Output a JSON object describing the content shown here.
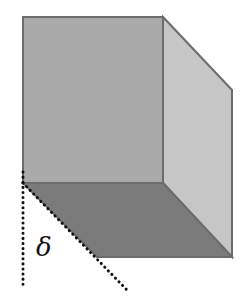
{
  "diagram": {
    "shape": "parallelepiped",
    "label": {
      "text": "δ",
      "meaning": "shear angle",
      "x": 36,
      "y": 256
    },
    "colors": {
      "front_face": "#a9a9a9",
      "right_face": "#c6c6c6",
      "bottom_face": "#7b7b7b",
      "edge": "#6c6c6c",
      "dotted_line": "#111111",
      "background": "#ffffff"
    },
    "faces": {
      "front": [
        [
          23,
          17
        ],
        [
          163,
          17
        ],
        [
          163,
          183
        ],
        [
          23,
          183
        ]
      ],
      "right": [
        [
          163,
          17
        ],
        [
          232,
          90
        ],
        [
          232,
          257
        ],
        [
          163,
          183
        ]
      ],
      "bottom": [
        [
          23,
          183
        ],
        [
          163,
          183
        ],
        [
          232,
          257
        ],
        [
          97,
          257
        ]
      ]
    },
    "reference_lines": {
      "vertical": {
        "x1": 23,
        "y1": 172,
        "x2": 23,
        "y2": 289,
        "style": "dotted"
      },
      "diagonal": {
        "x1": 23,
        "y1": 183,
        "x2": 128,
        "y2": 291,
        "style": "dotted"
      }
    }
  }
}
